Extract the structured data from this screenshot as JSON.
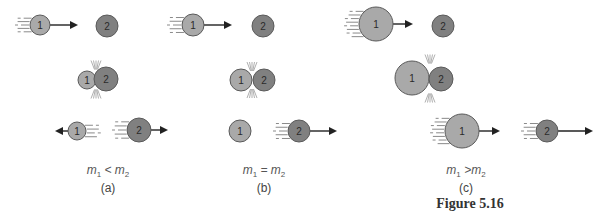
{
  "figure": {
    "title": "Figure 5.16",
    "colors": {
      "ball1_fill": "#a9a9a9",
      "ball2_fill": "#808080",
      "ball_stroke": "#5a5a5a",
      "arrow": "#222222",
      "motion_lines": "#8a8a8a",
      "impact_lines": "#9a9a9a"
    },
    "panels": [
      {
        "id": "a",
        "part_label": "(a)",
        "relation": {
          "m1": "m",
          "sub1": "1",
          "op": "<",
          "m2": "m",
          "sub2": "2"
        },
        "stages": [
          {
            "stage": "before",
            "balls": [
              {
                "label": "1",
                "cx": 40,
                "cy": 25,
                "r": 10,
                "arrow_to": 76,
                "arrow_dir": "right",
                "motion": "left"
              },
              {
                "label": "2",
                "cx": 107,
                "cy": 26,
                "r": 11
              }
            ]
          },
          {
            "stage": "collision",
            "balls": [
              {
                "label": "1",
                "cx": 87,
                "cy": 80,
                "r": 9
              },
              {
                "label": "2",
                "cx": 106,
                "cy": 79,
                "r": 12
              }
            ],
            "impact_x": 96
          },
          {
            "stage": "after",
            "balls": [
              {
                "label": "1",
                "cx": 77,
                "cy": 131,
                "r": 9,
                "arrow_to": 57,
                "arrow_dir": "left",
                "motion": "right"
              },
              {
                "label": "2",
                "cx": 139,
                "cy": 130,
                "r": 12,
                "arrow_to": 166,
                "arrow_dir": "right",
                "motion": "left"
              }
            ]
          }
        ]
      },
      {
        "id": "b",
        "part_label": "(b)",
        "relation": {
          "m1": "m",
          "sub1": "1",
          "op": "=",
          "m2": "m",
          "sub2": "2"
        },
        "stages": [
          {
            "stage": "before",
            "balls": [
              {
                "label": "1",
                "cx": 193,
                "cy": 25,
                "r": 11,
                "arrow_to": 230,
                "arrow_dir": "right",
                "motion": "left"
              },
              {
                "label": "2",
                "cx": 263,
                "cy": 26,
                "r": 11
              }
            ]
          },
          {
            "stage": "collision",
            "balls": [
              {
                "label": "1",
                "cx": 241,
                "cy": 80,
                "r": 11
              },
              {
                "label": "2",
                "cx": 264,
                "cy": 80,
                "r": 11
              }
            ],
            "impact_x": 252
          },
          {
            "stage": "after",
            "balls": [
              {
                "label": "1",
                "cx": 240,
                "cy": 131,
                "r": 11
              },
              {
                "label": "2",
                "cx": 299,
                "cy": 131,
                "r": 11,
                "arrow_to": 335,
                "arrow_dir": "right",
                "motion": "left"
              }
            ]
          }
        ]
      },
      {
        "id": "c",
        "part_label": "(c)",
        "relation": {
          "m1": "m",
          "sub1": "1",
          "op": ">",
          "m2": "m",
          "sub2": "2"
        },
        "stages": [
          {
            "stage": "before",
            "balls": [
              {
                "label": "1",
                "cx": 376,
                "cy": 24,
                "r": 17,
                "arrow_to": 411,
                "arrow_dir": "right",
                "motion": "left"
              },
              {
                "label": "2",
                "cx": 443,
                "cy": 26,
                "r": 11
              }
            ]
          },
          {
            "stage": "collision",
            "balls": [
              {
                "label": "1",
                "cx": 412,
                "cy": 78,
                "r": 17
              },
              {
                "label": "2",
                "cx": 441,
                "cy": 79,
                "r": 12
              }
            ],
            "impact_x": 430
          },
          {
            "stage": "after",
            "balls": [
              {
                "label": "1",
                "cx": 462,
                "cy": 131,
                "r": 17,
                "arrow_to": 498,
                "arrow_dir": "right",
                "motion": "left"
              },
              {
                "label": "2",
                "cx": 547,
                "cy": 131,
                "r": 11,
                "arrow_to": 591,
                "arrow_dir": "right",
                "motion": "left"
              }
            ]
          }
        ]
      }
    ]
  },
  "captions": {
    "a": {
      "x": 108,
      "rel_y": 163,
      "part_y": 181
    },
    "b": {
      "x": 264,
      "rel_y": 163,
      "part_y": 181
    },
    "c": {
      "x": 466,
      "rel_y": 163,
      "part_y": 181
    },
    "title": {
      "x": 470,
      "y": 196
    }
  }
}
